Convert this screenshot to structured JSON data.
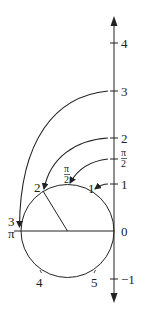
{
  "diagram": {
    "type": "polar-mapping",
    "axis": {
      "direction": "vertical",
      "tick_labels": [
        {
          "label": "4",
          "value": 4
        },
        {
          "label": "3",
          "value": 3
        },
        {
          "label": "2",
          "value": 2
        },
        {
          "label": "π",
          "sub": "2",
          "value": 1.5708
        },
        {
          "label": "1",
          "value": 1
        },
        {
          "label": "0",
          "value": 0
        },
        {
          "label": "−1",
          "value": -1
        }
      ]
    },
    "circle": {
      "labels": {
        "p1": "1",
        "p_half_pi": {
          "num": "π",
          "den": "2"
        },
        "p2": "2",
        "p3": "3",
        "p_pi": "π",
        "p4": "4",
        "p5": "5"
      }
    },
    "arrows": [
      {
        "from": "3",
        "to": "circle point 3"
      },
      {
        "from": "2",
        "to": "circle point 2"
      },
      {
        "from": "π/2",
        "to": "circle point π/2"
      },
      {
        "from": "1",
        "to": "circle point 1"
      }
    ],
    "colors": {
      "stroke": "#222222",
      "background": "#ffffff"
    }
  }
}
